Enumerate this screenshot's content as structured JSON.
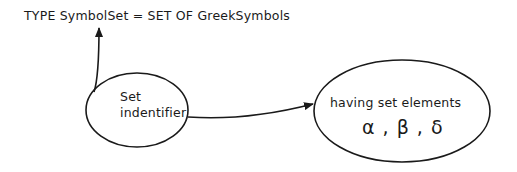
{
  "declaration": "TYPE SymbolSet = SET OF GreekSymbols",
  "nodes": {
    "set_identifier": {
      "line1": "Set",
      "line2": "indentifier"
    },
    "elements": {
      "label": "having set elements",
      "symbols": "α , β , δ"
    }
  },
  "colors": {
    "stroke": "#1a1a1a",
    "background": "#ffffff"
  }
}
